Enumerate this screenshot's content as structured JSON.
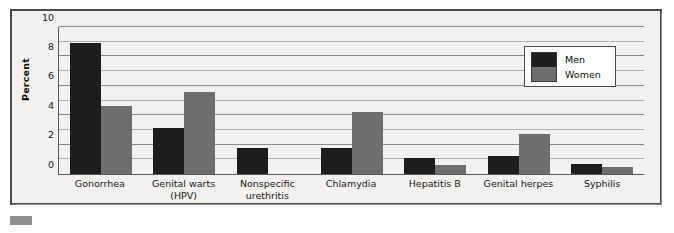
{
  "chart_data": {
    "type": "bar",
    "title": "",
    "xlabel": "",
    "ylabel": "Percent",
    "ylim": [
      0,
      10
    ],
    "yticks": [
      0,
      2,
      4,
      6,
      8,
      10
    ],
    "minor_gridlines": [
      1,
      3,
      5,
      7,
      9
    ],
    "grid": true,
    "legend_position": "upper-right",
    "categories": [
      "Gonorrhea",
      "Genital warts (HPV)",
      "Nonspecific urethritis",
      "Chlamydia",
      "Hepatitis B",
      "Genital herpes",
      "Syphilis"
    ],
    "category_lines": [
      [
        "Gonorrhea"
      ],
      [
        "Genital warts (HPV)"
      ],
      [
        "Nonspecific",
        "urethritis"
      ],
      [
        "Chlamydia"
      ],
      [
        "Hepatitis B"
      ],
      [
        "Genital herpes"
      ],
      [
        "Syphilis"
      ]
    ],
    "series": [
      {
        "name": "Men",
        "color": "#1d1d1d",
        "values": [
          8.9,
          3.1,
          1.8,
          1.8,
          1.1,
          1.2,
          0.7
        ]
      },
      {
        "name": "Women",
        "color": "#6e6e6e",
        "values": [
          4.6,
          5.6,
          null,
          4.2,
          0.6,
          2.7,
          0.5
        ]
      }
    ]
  },
  "legend": {
    "items": [
      {
        "label": "Men",
        "color": "#1d1d1d"
      },
      {
        "label": "Women",
        "color": "#6e6e6e"
      }
    ]
  },
  "axis": {
    "y_title": "Percent"
  },
  "colors": {
    "men": "#1d1d1d",
    "women": "#6e6e6e",
    "frame": "#4a4a4a",
    "plot_background": "#f2f1ef",
    "gridline": "#9a9a9a",
    "page_background": "#ffffff"
  }
}
